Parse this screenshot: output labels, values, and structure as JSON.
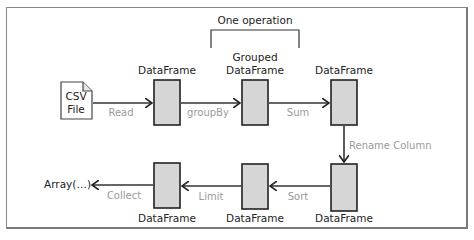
{
  "diagram": {
    "bracket_label": "One operation",
    "source": {
      "line1": "CSV",
      "line2": "File",
      "icon": "file-icon"
    },
    "output": "Array(…)",
    "nodes": [
      {
        "id": "df1",
        "label": "DataFrame"
      },
      {
        "id": "df2",
        "label_line1": "Grouped",
        "label_line2": "DataFrame"
      },
      {
        "id": "df3",
        "label": "DataFrame"
      },
      {
        "id": "df4",
        "label": "DataFrame"
      },
      {
        "id": "df5",
        "label": "DataFrame"
      },
      {
        "id": "df6",
        "label": "DataFrame"
      }
    ],
    "edges": [
      {
        "from": "csv",
        "to": "df1",
        "label": "Read"
      },
      {
        "from": "df1",
        "to": "df2",
        "label": "groupBy"
      },
      {
        "from": "df2",
        "to": "df3",
        "label": "Sum"
      },
      {
        "from": "df3",
        "to": "df4",
        "label": "Rename Column"
      },
      {
        "from": "df4",
        "to": "df5",
        "label": "Sort"
      },
      {
        "from": "df5",
        "to": "df6",
        "label": "Limit"
      },
      {
        "from": "df6",
        "to": "output",
        "label": "Collect"
      }
    ],
    "colors": {
      "box_fill": "#d6d6d6",
      "stroke": "#222222",
      "operation_text": "#9a9a9a"
    }
  }
}
